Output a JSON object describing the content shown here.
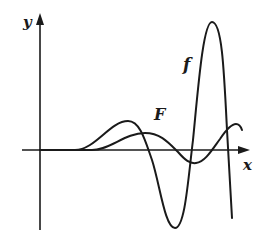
{
  "diagram": {
    "type": "function-graph",
    "axes": {
      "x_label": "x",
      "y_label": "y"
    },
    "curves": [
      {
        "name": "f",
        "label": "f",
        "description": "oscillating function with growing amplitude; small hump, deep trough, tall peak, then falls steeply"
      },
      {
        "name": "F",
        "label": "F",
        "description": "antiderivative of f; smoother oscillation with smaller amplitude"
      }
    ],
    "colors": {
      "stroke": "#1a1a1a",
      "background": "#ffffff"
    }
  }
}
